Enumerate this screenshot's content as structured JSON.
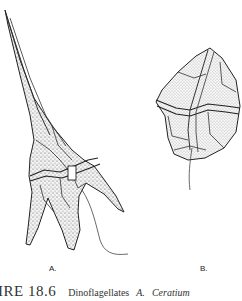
{
  "figure": {
    "caption_number": "IRE 18.6",
    "caption_text": "Dinoflagellates",
    "caption_part_a": "A.",
    "caption_genus_a": "Ceratium",
    "panels": [
      {
        "label": "A.",
        "subject": "Ceratium dinoflagellate with apical horn, antapical horns and flagellum"
      },
      {
        "label": "B.",
        "subject": "Armored dinoflagellate with thecal plates and flagellum"
      }
    ]
  }
}
